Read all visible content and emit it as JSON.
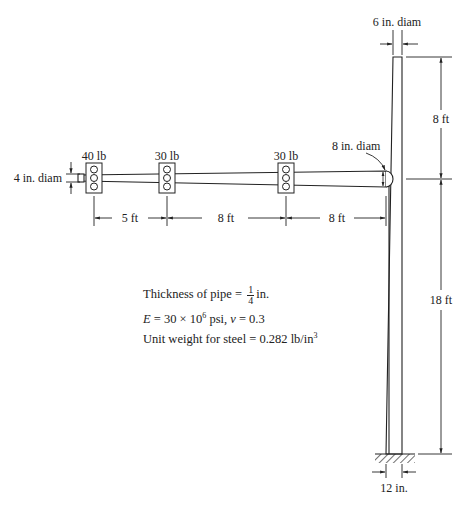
{
  "diagram": {
    "type": "traffic signal pole structure",
    "pole": {
      "top_diameter_label": "6 in. diam",
      "base_width_label": "12 in.",
      "upper_height_label": "8 ft",
      "lower_height_label": "18 ft"
    },
    "arm": {
      "tip_diameter_label": "4 in. diam",
      "root_diameter_label": "8 in. diam",
      "spans": [
        "5 ft",
        "8 ft",
        "8 ft"
      ]
    },
    "signals": [
      {
        "load": "40 lb"
      },
      {
        "load": "30 lb"
      },
      {
        "load": "30 lb"
      }
    ],
    "properties": {
      "thickness_prefix": "Thickness of pipe =",
      "thickness_num": "1",
      "thickness_den": "4",
      "thickness_unit": "in.",
      "modulus_E": "E",
      "modulus_text": " = 30 × 10",
      "modulus_exp": "6",
      "modulus_unit": " psi, ",
      "poisson_symbol": "ν",
      "poisson_value": " = 0.3",
      "unit_weight_text": "Unit weight for steel = 0.282 lb/in",
      "unit_weight_exp": "3"
    },
    "colors": {
      "line": "#222222",
      "background": "#ffffff"
    }
  }
}
